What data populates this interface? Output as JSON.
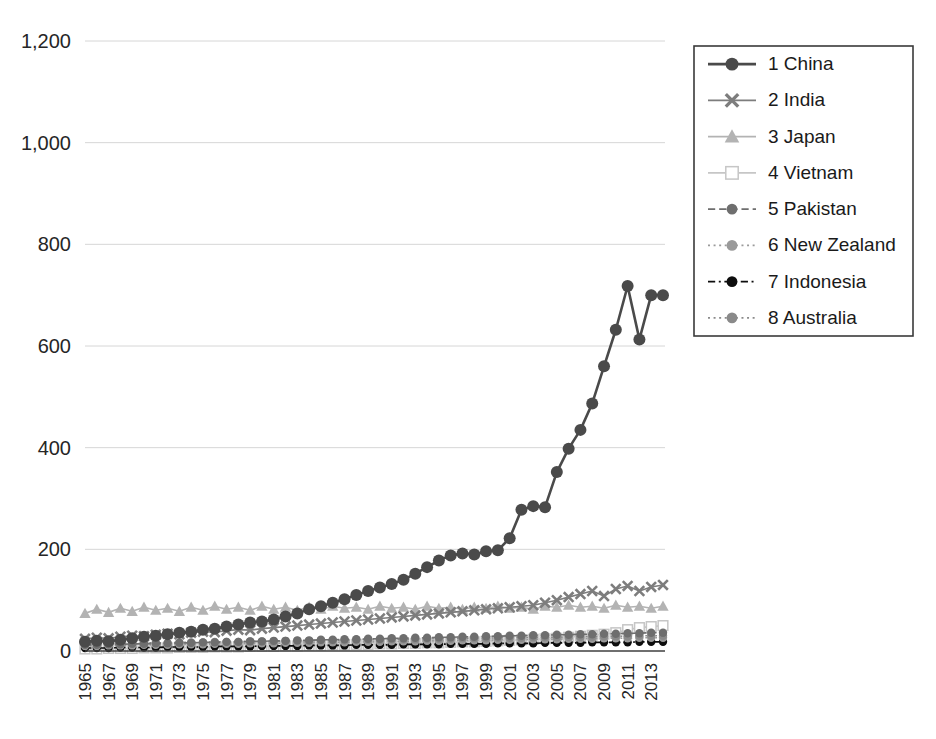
{
  "chart_data": {
    "type": "line",
    "title": "",
    "subtitle": "",
    "xlabel": "",
    "ylabel": "",
    "grid": true,
    "legend_position": "right",
    "xlim": [
      1965,
      2014
    ],
    "ylim": [
      0,
      1200
    ],
    "ytick_values": [
      0,
      200,
      400,
      600,
      800,
      1000,
      1200
    ],
    "ytick_labels": [
      "0",
      "200",
      "400",
      "600",
      "800",
      "1,000",
      "1,200"
    ],
    "xtick_labels": [
      "1965",
      "1967",
      "1969",
      "1971",
      "1973",
      "1975",
      "1977",
      "1979",
      "1981",
      "1983",
      "1985",
      "1987",
      "1989",
      "1991",
      "1993",
      "1995",
      "1997",
      "1999",
      "2001",
      "2003",
      "2005",
      "2007",
      "2009",
      "2011",
      "2013"
    ],
    "x": [
      1965,
      1966,
      1967,
      1968,
      1969,
      1970,
      1971,
      1972,
      1973,
      1974,
      1975,
      1976,
      1977,
      1978,
      1979,
      1980,
      1981,
      1982,
      1983,
      1984,
      1985,
      1986,
      1987,
      1988,
      1989,
      1990,
      1991,
      1992,
      1993,
      1994,
      1995,
      1996,
      1997,
      1998,
      1999,
      2000,
      2001,
      2002,
      2003,
      2004,
      2005,
      2006,
      2007,
      2008,
      2009,
      2010,
      2011,
      2012,
      2013,
      2014
    ],
    "series": [
      {
        "name": "1 China",
        "rank": 1,
        "color": "#4a4a4a",
        "marker": "circle",
        "dash": "solid",
        "values": [
          18,
          20,
          19,
          22,
          25,
          28,
          30,
          33,
          36,
          38,
          42,
          44,
          48,
          52,
          56,
          58,
          62,
          68,
          74,
          82,
          88,
          95,
          102,
          110,
          118,
          125,
          132,
          140,
          152,
          165,
          178,
          188,
          192,
          190,
          196,
          198,
          222,
          278,
          285,
          283,
          352,
          398,
          435,
          487,
          560,
          632,
          718,
          613,
          700,
          700
        ]
      },
      {
        "name": "2 India",
        "rank": 2,
        "color": "#7d7d7d",
        "marker": "x",
        "dash": "solid",
        "values": [
          24,
          26,
          25,
          28,
          30,
          29,
          32,
          34,
          33,
          36,
          38,
          37,
          40,
          42,
          41,
          44,
          46,
          48,
          50,
          52,
          54,
          56,
          58,
          60,
          62,
          64,
          66,
          68,
          70,
          72,
          74,
          76,
          78,
          80,
          82,
          84,
          86,
          88,
          90,
          95,
          100,
          106,
          112,
          118,
          108,
          122,
          128,
          118,
          126,
          130
        ]
      },
      {
        "name": "3 Japan",
        "rank": 3,
        "color": "#b3b3b3",
        "marker": "triangle",
        "dash": "solid",
        "values": [
          74,
          82,
          76,
          84,
          78,
          86,
          80,
          84,
          78,
          86,
          80,
          88,
          82,
          86,
          80,
          88,
          82,
          86,
          80,
          86,
          82,
          88,
          84,
          86,
          82,
          88,
          84,
          86,
          82,
          88,
          84,
          86,
          82,
          86,
          84,
          88,
          84,
          86,
          82,
          88,
          86,
          90,
          86,
          88,
          84,
          90,
          86,
          88,
          84,
          88
        ]
      },
      {
        "name": "4 Vietnam",
        "rank": 4,
        "color": "#c6c6c6",
        "marker": "square-open",
        "dash": "solid",
        "values": [
          4,
          4,
          5,
          5,
          5,
          6,
          6,
          6,
          7,
          7,
          7,
          8,
          8,
          8,
          9,
          9,
          9,
          10,
          10,
          11,
          11,
          12,
          12,
          13,
          13,
          14,
          14,
          15,
          15,
          16,
          16,
          17,
          18,
          18,
          19,
          20,
          21,
          22,
          23,
          24,
          25,
          27,
          29,
          31,
          33,
          36,
          42,
          46,
          48,
          50
        ]
      },
      {
        "name": "5 Pakistan",
        "rank": 5,
        "color": "#6e6e6e",
        "marker": "circle",
        "dash": "dashed",
        "values": [
          12,
          12,
          13,
          13,
          14,
          14,
          15,
          15,
          16,
          16,
          17,
          17,
          18,
          18,
          19,
          19,
          20,
          20,
          21,
          21,
          22,
          22,
          23,
          23,
          24,
          24,
          25,
          25,
          26,
          26,
          27,
          27,
          28,
          28,
          29,
          29,
          30,
          30,
          31,
          31,
          32,
          32,
          33,
          33,
          34,
          34,
          35,
          35,
          36,
          36
        ]
      },
      {
        "name": "6 New Zealand",
        "rank": 6,
        "color": "#9a9a9a",
        "marker": "circle",
        "dash": "dotted",
        "values": [
          10,
          10,
          11,
          11,
          11,
          12,
          12,
          12,
          13,
          13,
          13,
          14,
          14,
          14,
          15,
          15,
          15,
          16,
          16,
          16,
          17,
          17,
          17,
          18,
          18,
          18,
          19,
          19,
          19,
          20,
          20,
          20,
          21,
          21,
          21,
          22,
          22,
          22,
          23,
          23,
          23,
          24,
          24,
          24,
          25,
          25,
          25,
          26,
          26,
          26
        ]
      },
      {
        "name": "7 Indonesia",
        "rank": 7,
        "color": "#0d0d0d",
        "marker": "circle",
        "dash": "dashdot",
        "values": [
          6,
          6,
          6,
          7,
          7,
          7,
          7,
          8,
          8,
          8,
          8,
          9,
          9,
          9,
          9,
          10,
          10,
          10,
          10,
          11,
          11,
          11,
          11,
          12,
          12,
          12,
          12,
          13,
          13,
          13,
          13,
          14,
          14,
          14,
          14,
          15,
          15,
          15,
          15,
          16,
          16,
          16,
          16,
          17,
          17,
          17,
          17,
          18,
          18,
          18
        ]
      },
      {
        "name": "8 Australia",
        "rank": 8,
        "color": "#8a8a8a",
        "marker": "circle",
        "dash": "dotted",
        "values": [
          14,
          14,
          15,
          15,
          15,
          16,
          16,
          16,
          17,
          17,
          17,
          18,
          18,
          18,
          19,
          19,
          19,
          20,
          20,
          20,
          21,
          21,
          21,
          22,
          22,
          22,
          23,
          23,
          23,
          24,
          24,
          24,
          25,
          25,
          25,
          26,
          26,
          26,
          27,
          27,
          27,
          28,
          28,
          28,
          29,
          29,
          29,
          30,
          30,
          30
        ]
      }
    ]
  },
  "legend": {
    "items": [
      {
        "label": "1 China"
      },
      {
        "label": "2 India"
      },
      {
        "label": "3 Japan"
      },
      {
        "label": "4 Vietnam"
      },
      {
        "label": "5 Pakistan"
      },
      {
        "label": "6 New Zealand"
      },
      {
        "label": "7 Indonesia"
      },
      {
        "label": "8 Australia"
      }
    ]
  }
}
